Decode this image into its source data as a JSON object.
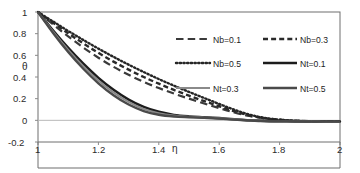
{
  "chart_data": {
    "type": "line",
    "title": "",
    "subtitle": "",
    "xlabel": "η",
    "ylabel": "θ",
    "xlim": [
      1,
      2
    ],
    "ylim": [
      -0.2,
      1
    ],
    "grid": false,
    "legend_position": "inside-upper-right",
    "xticks": [
      "1",
      "1.2",
      "1.4",
      "1.6",
      "1.8",
      "2"
    ],
    "xtick_values": [
      1,
      1.2,
      1.4,
      1.6,
      1.8,
      2
    ],
    "yticks": [
      "1",
      "0.8",
      "0.6",
      "0.4",
      "0.2",
      "0",
      "-0.2"
    ],
    "ytick_values": [
      1,
      0.8,
      0.6,
      0.4,
      0.2,
      0,
      -0.2
    ],
    "x": [
      1.0,
      1.05,
      1.1,
      1.15,
      1.2,
      1.25,
      1.3,
      1.35,
      1.4,
      1.45,
      1.5,
      1.55,
      1.6,
      1.65,
      1.7,
      1.75,
      1.8,
      1.85,
      1.9,
      1.95,
      2.0
    ],
    "series": [
      {
        "name": "Nb=0.1",
        "style": "long-dash",
        "color": "#3a3a3a",
        "width": 2.2,
        "values": [
          1.0,
          0.885,
          0.775,
          0.672,
          0.578,
          0.494,
          0.42,
          0.355,
          0.298,
          0.247,
          0.2,
          0.156,
          0.113,
          0.072,
          0.04,
          0.018,
          0.004,
          -0.004,
          -0.008,
          -0.01,
          -0.011
        ]
      },
      {
        "name": "Nb=0.3",
        "style": "medium-dash",
        "color": "#2a2a2a",
        "width": 2.4,
        "values": [
          1.0,
          0.9,
          0.803,
          0.71,
          0.623,
          0.542,
          0.468,
          0.4,
          0.338,
          0.281,
          0.228,
          0.178,
          0.13,
          0.084,
          0.046,
          0.02,
          0.005,
          -0.004,
          -0.008,
          -0.01,
          -0.011
        ]
      },
      {
        "name": "Nb=0.5",
        "style": "dotted",
        "color": "#262626",
        "width": 2.4,
        "values": [
          1.0,
          0.912,
          0.825,
          0.742,
          0.662,
          0.586,
          0.514,
          0.446,
          0.381,
          0.32,
          0.262,
          0.206,
          0.151,
          0.098,
          0.053,
          0.023,
          0.006,
          -0.004,
          -0.008,
          -0.01,
          -0.011
        ]
      },
      {
        "name": "Nt=0.1",
        "style": "solid",
        "color": "#1c1c1c",
        "width": 2.6,
        "values": [
          1.0,
          0.828,
          0.668,
          0.522,
          0.392,
          0.282,
          0.192,
          0.124,
          0.078,
          0.05,
          0.036,
          0.028,
          0.02,
          0.01,
          0.001,
          -0.005,
          -0.008,
          -0.01,
          -0.011,
          -0.011,
          -0.012
        ]
      },
      {
        "name": "Nt=0.3",
        "style": "solid",
        "color": "#8a8a8a",
        "width": 2.0,
        "values": [
          1.0,
          0.818,
          0.65,
          0.5,
          0.368,
          0.258,
          0.17,
          0.106,
          0.066,
          0.044,
          0.034,
          0.027,
          0.019,
          0.009,
          0.0,
          -0.006,
          -0.009,
          -0.01,
          -0.011,
          -0.012,
          -0.012
        ]
      },
      {
        "name": "Nt=0.5",
        "style": "solid",
        "color": "#4a4a4a",
        "width": 2.4,
        "values": [
          1.0,
          0.806,
          0.63,
          0.476,
          0.342,
          0.232,
          0.146,
          0.086,
          0.052,
          0.036,
          0.029,
          0.023,
          0.016,
          0.007,
          -0.001,
          -0.007,
          -0.009,
          -0.011,
          -0.012,
          -0.012,
          -0.012
        ]
      }
    ]
  },
  "legend": {
    "entries": [
      {
        "label": "Nb=0.1",
        "swatch": "long-dash-swatch"
      },
      {
        "label": "Nb=0.3",
        "swatch": "medium-dash-swatch"
      },
      {
        "label": "Nb=0.5",
        "swatch": "dotted-swatch"
      },
      {
        "label": "Nt=0.1",
        "swatch": "solid-swatch"
      },
      {
        "label": "Nt=0.3",
        "swatch": "solid-light-swatch"
      },
      {
        "label": "Nt=0.5",
        "swatch": "solid-swatch"
      }
    ]
  }
}
